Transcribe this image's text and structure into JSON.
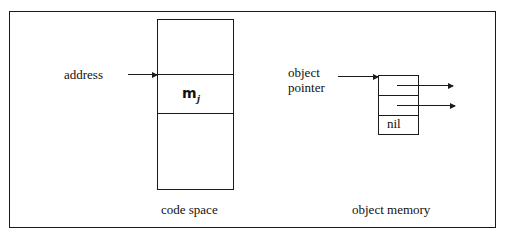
{
  "figure": {
    "caption_left": "code space",
    "caption_right": "object memory",
    "border_color": "#1a1a1a",
    "background_color": "#ffffff"
  },
  "code_space": {
    "label_address": "address",
    "label_method": "m",
    "label_method_subscript": "j",
    "cells": [
      {
        "name": "upper-region",
        "text": ""
      },
      {
        "name": "method-region",
        "text": "m"
      },
      {
        "name": "lower-region",
        "text": ""
      }
    ]
  },
  "object_memory": {
    "label_pointer_line1": "object",
    "label_pointer_line2": "pointer",
    "slots": [
      {
        "name": "slot-1",
        "text": "",
        "has_outgoing_pointer": true
      },
      {
        "name": "slot-2",
        "text": "",
        "has_outgoing_pointer": true
      },
      {
        "name": "slot-3",
        "text": "nil",
        "has_outgoing_pointer": false
      }
    ],
    "label_nil": "nil"
  },
  "arrows": {
    "address_to_code_space": "address-pointer-arrow",
    "pointer_to_object": "object-pointer-arrow",
    "slot1_out": "slot-1-outgoing-arrow",
    "slot2_out": "slot-2-outgoing-arrow"
  }
}
